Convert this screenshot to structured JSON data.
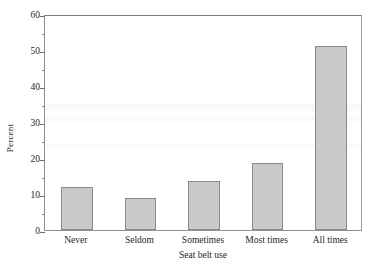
{
  "chart_data": {
    "type": "bar",
    "title": "",
    "xlabel": "Seat belt use",
    "ylabel": "Percent",
    "categories": [
      "Never",
      "Seldom",
      "Sometimes",
      "Most times",
      "All times"
    ],
    "values": [
      12.0,
      8.9,
      13.6,
      18.5,
      51.2
    ],
    "series": [
      {
        "name": "Percent",
        "values": [
          12.0,
          8.9,
          13.6,
          18.5,
          51.2
        ]
      }
    ],
    "ylim": [
      0,
      60
    ],
    "xlim": [
      0,
      5
    ],
    "ytick_labels": [
      "0",
      "10",
      "20",
      "30",
      "40",
      "50",
      "60"
    ],
    "ytick_values": [
      0,
      10,
      20,
      30,
      40,
      50,
      60
    ],
    "yminor_tick_values": [
      5,
      15,
      25,
      35,
      45,
      55
    ],
    "grid": false,
    "legend": "none",
    "bar_color": "#c9c9c9",
    "bar_edge_color": "#8a8a8a",
    "axis_color": "#8f8f8f",
    "background_color": "#ffffff"
  }
}
